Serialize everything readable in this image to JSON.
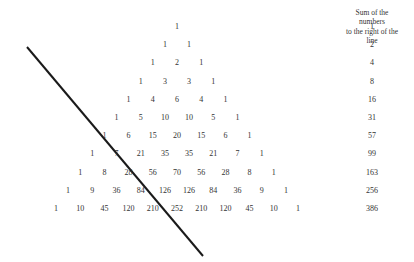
{
  "header": {
    "lines": [
      "Sum of the",
      "numbers",
      "to the right of the",
      "line"
    ]
  },
  "triangle": {
    "rows": [
      [
        1
      ],
      [
        1,
        1
      ],
      [
        1,
        2,
        1
      ],
      [
        1,
        3,
        3,
        1
      ],
      [
        1,
        4,
        6,
        4,
        1
      ],
      [
        1,
        5,
        10,
        10,
        5,
        1
      ],
      [
        1,
        6,
        15,
        20,
        15,
        6,
        1
      ],
      [
        1,
        7,
        21,
        35,
        35,
        21,
        7,
        1
      ],
      [
        1,
        8,
        28,
        56,
        70,
        56,
        28,
        8,
        1
      ],
      [
        1,
        9,
        36,
        84,
        126,
        126,
        84,
        36,
        9,
        1
      ],
      [
        1,
        10,
        45,
        120,
        210,
        252,
        210,
        120,
        45,
        10,
        1
      ]
    ]
  },
  "sums": [
    "1",
    "2",
    "4",
    "8",
    "16",
    "31",
    "57",
    "99",
    "163",
    "256",
    "386"
  ],
  "line": {
    "x1": 27,
    "y1": 47,
    "x2": 203,
    "y2": 256,
    "color": "#1a1a1a"
  }
}
